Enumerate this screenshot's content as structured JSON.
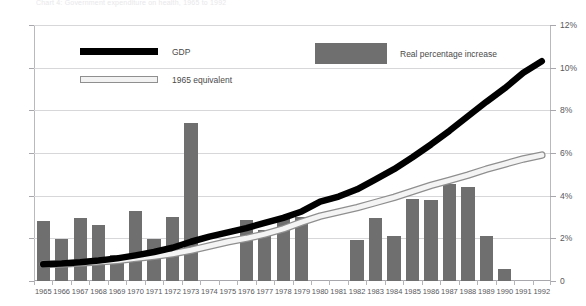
{
  "figure": {
    "faint_header": "Chart 4:  Government expenditure on health, 1965 to 1992",
    "plot": {
      "x": 34,
      "y": 25,
      "width": 517,
      "height": 256
    }
  },
  "legend": {
    "items": [
      {
        "name": "gdp",
        "label": "GDP",
        "marker": "thick-black-line",
        "color": "#000000"
      },
      {
        "name": "equivalent-1965",
        "label": "1965 equivalent",
        "marker": "hollow-line",
        "color": "#f2f2f2"
      },
      {
        "name": "real-percentage-increase",
        "label": "Real percentage increase",
        "marker": "filled-rectangle",
        "color": "#6f6f6f"
      }
    ]
  },
  "chart_data": {
    "type": "bar",
    "title": "",
    "xlabel": "",
    "ylabel": "",
    "grid": true,
    "legend_position": "inside-top",
    "categories": [
      "1965",
      "1966",
      "1967",
      "1968",
      "1969",
      "1970",
      "1971",
      "1972",
      "1973",
      "1974",
      "1975",
      "1976",
      "1977",
      "1978",
      "1979",
      "1980",
      "1981",
      "1982",
      "1983",
      "1984",
      "1985",
      "1986",
      "1987",
      "1988",
      "1989",
      "1990",
      "1991",
      "1992"
    ],
    "axes": {
      "left": {
        "label": "",
        "ylim": [
          0,
          600
        ],
        "ticks": [
          0,
          100,
          200,
          300,
          400,
          500,
          600
        ],
        "ticklabels": [
          "0",
          "100",
          "200",
          "300",
          "400",
          "500",
          "600"
        ]
      },
      "right": {
        "label": "",
        "ylim": [
          0,
          12
        ],
        "ticks": [
          0,
          2,
          4,
          6,
          8,
          10,
          12
        ],
        "ticklabels": [
          "0",
          "2%",
          "4%",
          "6%",
          "8%",
          "10%",
          "12%"
        ]
      }
    },
    "series": [
      {
        "name": "Real percentage increase",
        "type": "bar",
        "axis": "right",
        "color": "#6f6f6f",
        "unit": "%",
        "values": [
          2.8,
          1.96,
          2.96,
          2.62,
          1.2,
          3.26,
          1.96,
          3.02,
          7.4,
          0,
          0,
          2.84,
          2.4,
          2.96,
          3.0,
          0,
          0,
          1.9,
          2.96,
          2.1,
          3.86,
          3.8,
          4.56,
          4.4,
          2.1,
          0.54,
          0,
          0
        ]
      },
      {
        "name": "GDP",
        "type": "line",
        "axis": "left",
        "color": "#000000",
        "values": [
          39,
          41,
          44,
          48,
          53,
          60,
          68,
          78,
          92,
          104,
          114,
          124,
          136,
          148,
          163,
          186,
          198,
          215,
          238,
          262,
          290,
          320,
          352,
          386,
          420,
          452,
          488,
          515
        ]
      },
      {
        "name": "1965 equivalent",
        "type": "line",
        "axis": "left",
        "color": "#f2f2f2",
        "values": [
          39,
          40,
          42,
          45,
          48,
          53,
          58,
          64,
          72,
          82,
          92,
          100,
          110,
          122,
          138,
          152,
          162,
          172,
          184,
          196,
          210,
          224,
          236,
          248,
          262,
          274,
          286,
          295
        ]
      }
    ]
  }
}
